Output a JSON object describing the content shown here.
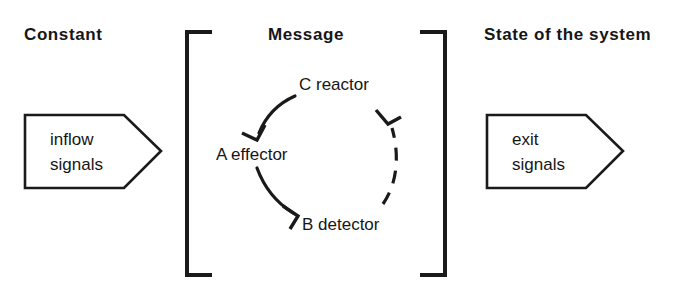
{
  "figure": {
    "width": 685,
    "height": 297,
    "background_color": "#ffffff",
    "ink_color": "#1a1a1a"
  },
  "headings": {
    "left": "Constant",
    "center": "Message",
    "right": "State of the system"
  },
  "inflow_arrow": {
    "line1": "inflow",
    "line2": "signals",
    "shape": "right-pointing-pentagon-arrow"
  },
  "exit_arrow": {
    "line1": "exit",
    "line2": "signals",
    "shape": "right-pointing-pentagon-arrow"
  },
  "bracket": {
    "left_shape": "left-square-bracket",
    "right_shape": "right-square-bracket"
  },
  "cycle": {
    "nodes": [
      {
        "id": "C",
        "label": "C reactor"
      },
      {
        "id": "A",
        "label": "A effector"
      },
      {
        "id": "B",
        "label": "B detector"
      }
    ],
    "edges": [
      {
        "from": "C",
        "to": "A",
        "style": "solid",
        "arrowhead": "open-v"
      },
      {
        "from": "A",
        "to": "B",
        "style": "solid",
        "arrowhead": "open-v"
      },
      {
        "from": "B",
        "to": "C",
        "style": "dashed",
        "arrowhead": "open-v"
      }
    ]
  }
}
